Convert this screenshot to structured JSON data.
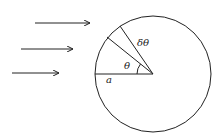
{
  "diagram": {
    "type": "geometry-figure",
    "colors": {
      "stroke": "#222222",
      "background": "#ffffff"
    },
    "labels": {
      "radius": "a",
      "angle": "θ",
      "small_angle": "δθ"
    },
    "circle": {
      "cx": 153,
      "cy": 74,
      "r": 58
    },
    "arrows": [
      {
        "x1": 35,
        "y1": 23,
        "x2": 90,
        "y2": 23
      },
      {
        "x1": 21,
        "y1": 49,
        "x2": 73,
        "y2": 49
      },
      {
        "x1": 12,
        "y1": 73,
        "x2": 59,
        "y2": 73
      }
    ],
    "radii": [
      {
        "name": "horizontal-radius",
        "x2": 96,
        "y2": 74
      },
      {
        "name": "theta-radius",
        "x2": 107,
        "y2": 37
      },
      {
        "name": "theta-plus-dtheta-radius",
        "x2": 120,
        "y2": 26
      }
    ]
  }
}
